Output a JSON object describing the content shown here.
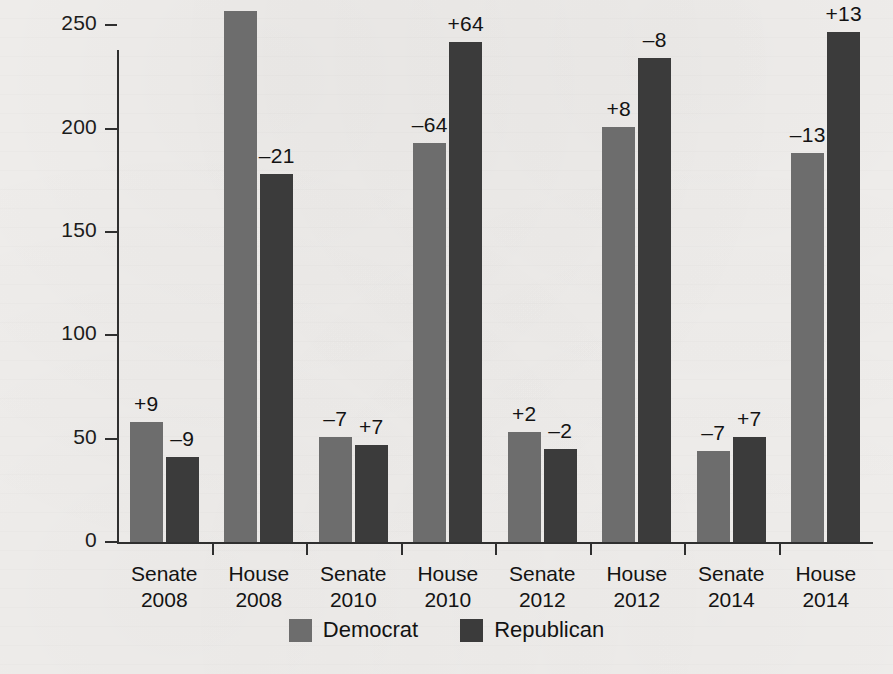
{
  "chart_data": {
    "type": "bar",
    "title": "",
    "subtitle": "",
    "xlabel": "",
    "ylabel": "",
    "ylim": [
      0,
      270
    ],
    "yticks": [
      0,
      50,
      100,
      150,
      200,
      250
    ],
    "ytick_labels": [
      "0",
      "50",
      "100",
      "150",
      "200",
      "250"
    ],
    "grid": false,
    "legend_position": "bottom",
    "categories": [
      "Senate 2008",
      "House 2008",
      "Senate 2010",
      "House 2010",
      "Senate 2012",
      "House 2012",
      "Senate 2014",
      "House 2014"
    ],
    "category_lines": [
      [
        "Senate",
        "2008"
      ],
      [
        "House",
        "2008"
      ],
      [
        "Senate",
        "2010"
      ],
      [
        "House",
        "2010"
      ],
      [
        "Senate",
        "2012"
      ],
      [
        "House",
        "2012"
      ],
      [
        "Senate",
        "2014"
      ],
      [
        "House",
        "2014"
      ]
    ],
    "series": [
      {
        "name": "Democrat",
        "color": "#6d6d6d",
        "values": [
          58,
          257,
          51,
          193,
          53,
          201,
          44,
          188
        ],
        "annotations": [
          "+9",
          "+21",
          "–7",
          "–64",
          "+2",
          "+8",
          "–7",
          "–13"
        ]
      },
      {
        "name": "Republican",
        "color": "#3b3b3b",
        "values": [
          41,
          178,
          47,
          242,
          45,
          234,
          51,
          247
        ],
        "annotations": [
          "–9",
          "–21",
          "+7",
          "+64",
          "–2",
          "–8",
          "+7",
          "+13"
        ]
      }
    ]
  },
  "legend": {
    "items": [
      {
        "label": "Democrat",
        "color": "#6d6d6d"
      },
      {
        "label": "Republican",
        "color": "#3b3b3b"
      }
    ]
  },
  "colors": {
    "democrat": "#6d6d6d",
    "republican": "#3b3b3b",
    "axis": "#2f2f2f",
    "text": "#131313",
    "background": "#f2f0ee"
  }
}
